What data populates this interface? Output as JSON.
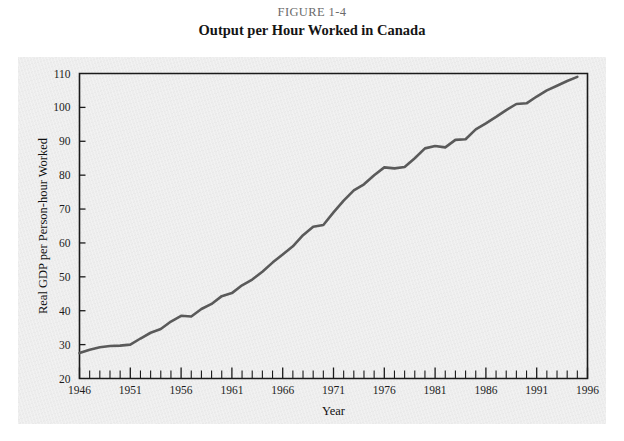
{
  "figure": {
    "number_label": "FIGURE 1-4",
    "title": "Output per Hour Worked in Canada"
  },
  "chart_data": {
    "type": "line",
    "title": "Output per Hour Worked in Canada",
    "xlabel": "Year",
    "ylabel": "Real GDP per Person-hour Worked",
    "xlim": [
      1946,
      1996
    ],
    "ylim": [
      20,
      110
    ],
    "ytick_step": 10,
    "ytick_labels": [
      "20",
      "30",
      "40",
      "50",
      "60",
      "70",
      "80",
      "90",
      "100",
      "110"
    ],
    "ytick_values": [
      20,
      30,
      40,
      50,
      60,
      70,
      80,
      90,
      100,
      110
    ],
    "xtick_labels": [
      "1946",
      "1951",
      "1956",
      "1961",
      "1966",
      "1971",
      "1976",
      "1981",
      "1986",
      "1991",
      "1996"
    ],
    "xtick_values": [
      1946,
      1951,
      1956,
      1961,
      1966,
      1971,
      1976,
      1981,
      1986,
      1991,
      1996
    ],
    "xtick_minor_step": 1,
    "grid": false,
    "legend": null,
    "line_color": "#5a5a5a",
    "x": [
      1946,
      1947,
      1948,
      1949,
      1950,
      1951,
      1952,
      1953,
      1954,
      1955,
      1956,
      1957,
      1958,
      1959,
      1960,
      1961,
      1962,
      1963,
      1964,
      1965,
      1966,
      1967,
      1968,
      1969,
      1970,
      1971,
      1972,
      1973,
      1974,
      1975,
      1976,
      1977,
      1978,
      1979,
      1980,
      1981,
      1982,
      1983,
      1984,
      1985,
      1986,
      1987,
      1988,
      1989,
      1990,
      1991,
      1992,
      1993,
      1994,
      1995
    ],
    "y": [
      27.5,
      28.5,
      29.2,
      29.6,
      29.7,
      30.0,
      31.8,
      33.5,
      34.6,
      36.8,
      38.5,
      38.3,
      40.5,
      42.0,
      44.3,
      45.2,
      47.5,
      49.2,
      51.5,
      54.2,
      56.6,
      59.0,
      62.3,
      64.8,
      65.3,
      69.0,
      72.5,
      75.5,
      77.3,
      80.0,
      82.3,
      82.0,
      82.4,
      85.0,
      87.9,
      88.6,
      88.2,
      90.4,
      90.6,
      93.5,
      95.3,
      97.2,
      99.2,
      101.0,
      101.2,
      103.2,
      105.0,
      106.4,
      107.8,
      109.0
    ]
  }
}
